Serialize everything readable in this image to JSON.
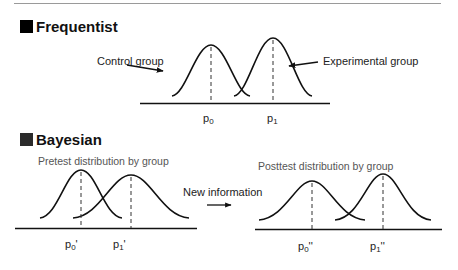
{
  "colors": {
    "frequentist_square": "#000000",
    "bayesian_square": "#2b2b2b",
    "rule": "#9a9a9a",
    "curve": "#111111",
    "caption_gray": "#555555"
  },
  "frequentist": {
    "title": "Frequentist",
    "control_label": "Control group",
    "experimental_label": "Experimental group",
    "p0": {
      "base": "p",
      "sub": "0",
      "prime": ""
    },
    "p1": {
      "base": "p",
      "sub": "1",
      "prime": ""
    }
  },
  "bayesian": {
    "title": "Bayesian",
    "pretest_caption": "Pretest distribution by group",
    "posttest_caption": "Posttest distribution by group",
    "arrow_label": "New information",
    "pre_p0": {
      "base": "p",
      "sub": "0",
      "prime": "'"
    },
    "pre_p1": {
      "base": "p",
      "sub": "1",
      "prime": "'"
    },
    "post_p0": {
      "base": "p",
      "sub": "0",
      "prime": "''"
    },
    "post_p1": {
      "base": "p",
      "sub": "1",
      "prime": "''"
    }
  }
}
